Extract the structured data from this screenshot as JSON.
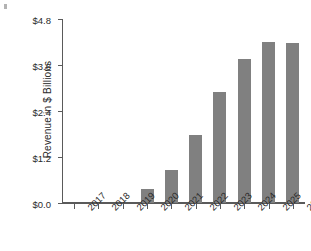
{
  "figure": {
    "background_color": "#ffffff",
    "bar_color": "#808080",
    "axis_color": "#5a5a5a",
    "text_color": "#2b2b2b"
  },
  "axes": {
    "ylabel": "Revenue in $ Billions",
    "yticklabels": [
      "$0.0",
      "$1.2",
      "$2.4",
      "$3.6",
      "$4.8"
    ],
    "xticklabels": [
      "2017",
      "2018",
      "2019",
      "2020",
      "2021",
      "2022",
      "2023",
      "2024",
      "2025",
      "2026"
    ]
  },
  "chart_data": {
    "type": "bar",
    "title": "",
    "xlabel": "",
    "ylabel": "Revenue in $ Billions",
    "categories": [
      "2017",
      "2018",
      "2019",
      "2020",
      "2021",
      "2022",
      "2023",
      "2024",
      "2025",
      "2026"
    ],
    "values": [
      0,
      0,
      0,
      0.36,
      0.86,
      1.78,
      2.9,
      3.75,
      4.2,
      4.17
    ],
    "ylim": [
      0,
      4.8
    ],
    "yticks": [
      0,
      1.2,
      2.4,
      3.6,
      4.8
    ],
    "ytick_labels": [
      "$0.0",
      "$1.2",
      "$2.4",
      "$3.6",
      "$4.8"
    ],
    "grid": false,
    "legend": null,
    "series": [
      {
        "name": "Revenue",
        "values": [
          0,
          0,
          0,
          0.36,
          0.86,
          1.78,
          2.9,
          3.75,
          4.2,
          4.17
        ]
      }
    ]
  }
}
